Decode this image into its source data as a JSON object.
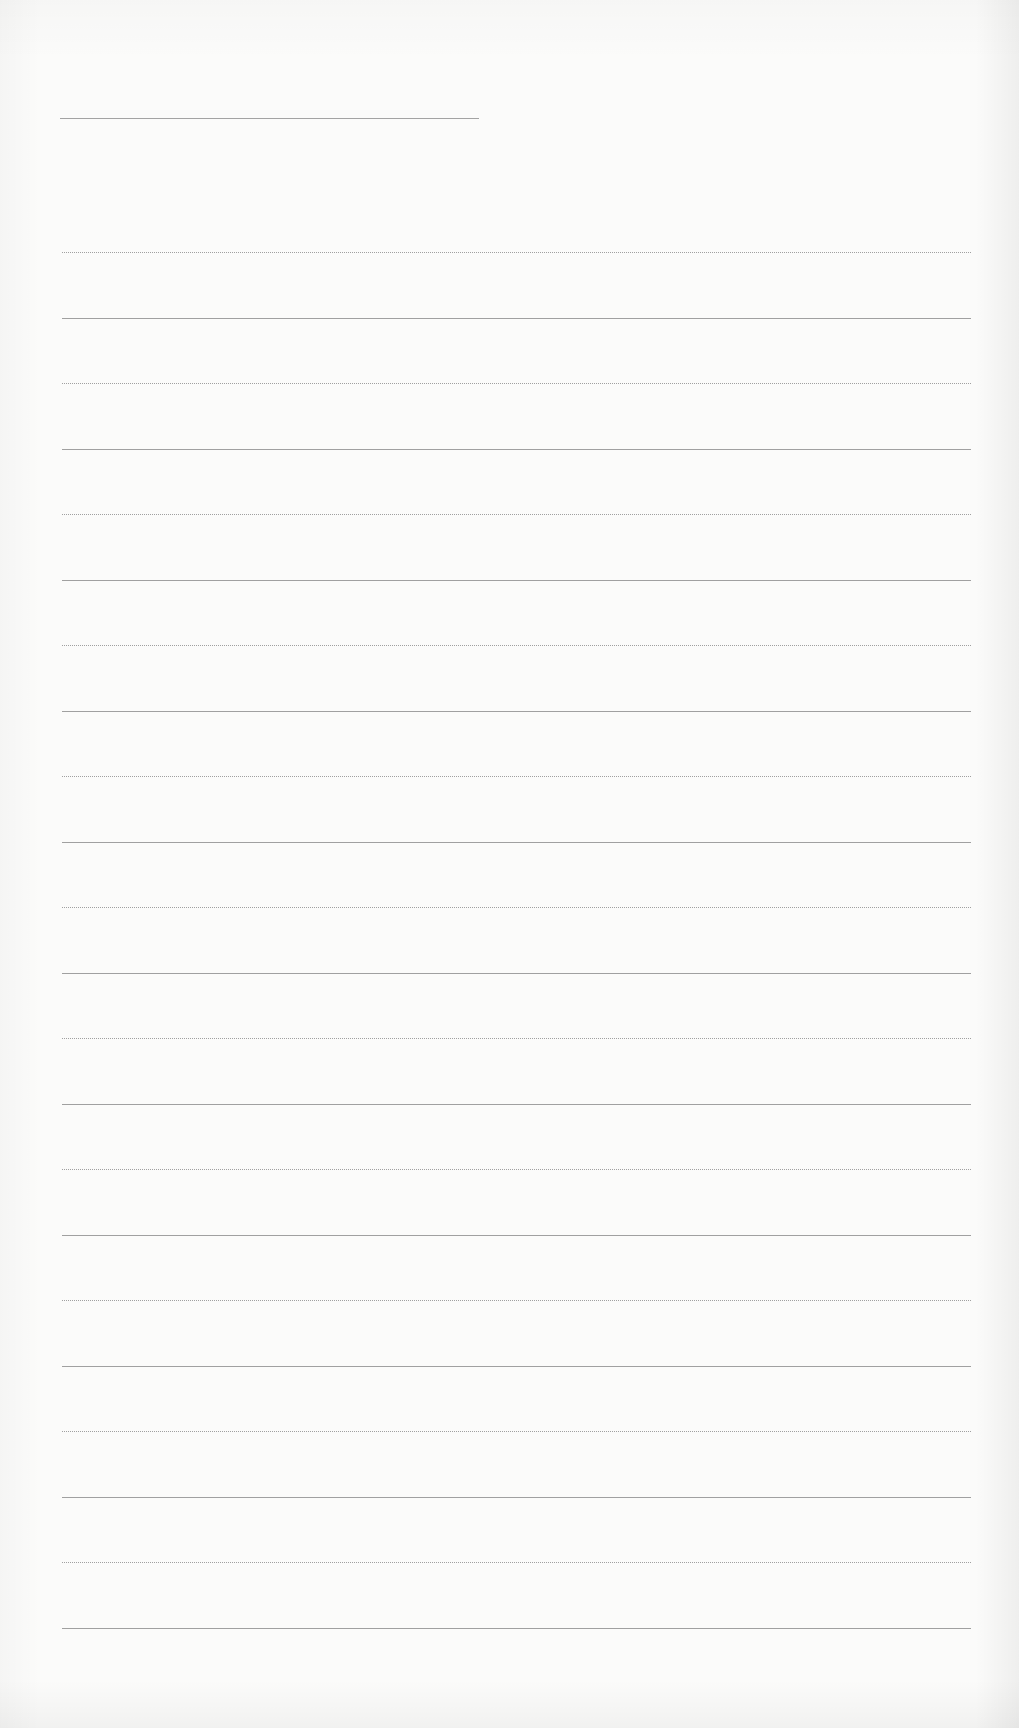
{
  "document": {
    "type": "blank ruled writing paper",
    "title_line": {
      "label": "",
      "value": ""
    },
    "ruled_lines": {
      "count": 22,
      "first_y": 252,
      "spacing_px": 65.5,
      "line_color": "#a0a0a0",
      "entries": [
        "",
        "",
        "",
        "",
        "",
        "",
        "",
        "",
        "",
        "",
        "",
        "",
        "",
        "",
        "",
        "",
        "",
        "",
        "",
        "",
        "",
        ""
      ]
    },
    "colors": {
      "paper": "#fbfbfa",
      "rule": "#a0a0a0"
    }
  }
}
